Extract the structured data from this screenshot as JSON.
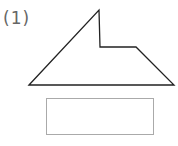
{
  "problem": {
    "label": "(1)",
    "shape": {
      "type": "polygon",
      "points": [
        [
          29,
          85
        ],
        [
          99,
          10
        ],
        [
          100,
          47
        ],
        [
          136,
          47
        ],
        [
          174,
          85
        ]
      ],
      "stroke": "#222222"
    },
    "answer_box": {
      "value": ""
    }
  }
}
